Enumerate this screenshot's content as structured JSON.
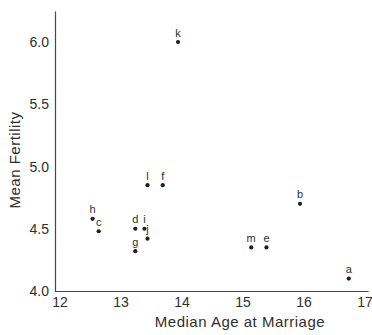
{
  "figure": {
    "background": "#ffffff",
    "ink_color": "#2e2e2e",
    "axis_color": "#474747"
  },
  "chart_data": {
    "type": "scatter",
    "title": "",
    "xlabel": "Median Age at Marriage",
    "ylabel": "Mean Fertility",
    "xlim": [
      12,
      17
    ],
    "ylim": [
      4.0,
      6.25
    ],
    "x_ticks": [
      "12",
      "13",
      "14",
      "15",
      "16",
      "17"
    ],
    "y_ticks": [
      "4.0",
      "4.5",
      "5.0",
      "5.5",
      "6.0"
    ],
    "grid": false,
    "legend": false,
    "marker": "filled-dot",
    "point_label_position": "above",
    "points": [
      {
        "label": "a",
        "x": 16.8,
        "y": 4.1
      },
      {
        "label": "b",
        "x": 16.0,
        "y": 4.7
      },
      {
        "label": "c",
        "x": 12.7,
        "y": 4.48
      },
      {
        "label": "d",
        "x": 13.3,
        "y": 4.5
      },
      {
        "label": "e",
        "x": 15.45,
        "y": 4.35
      },
      {
        "label": "f",
        "x": 13.75,
        "y": 4.85
      },
      {
        "label": "g",
        "x": 13.3,
        "y": 4.32
      },
      {
        "label": "h",
        "x": 12.6,
        "y": 4.58
      },
      {
        "label": "i",
        "x": 13.45,
        "y": 4.5
      },
      {
        "label": "j",
        "x": 13.5,
        "y": 4.42
      },
      {
        "label": "k",
        "x": 14.0,
        "y": 6.0
      },
      {
        "label": "l",
        "x": 13.5,
        "y": 4.85
      },
      {
        "label": "m",
        "x": 15.2,
        "y": 4.35
      }
    ]
  }
}
